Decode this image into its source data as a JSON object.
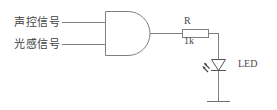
{
  "diagram": {
    "background_color": "#ffffff",
    "line_color": "#808080",
    "text_color": "#4a4a4a",
    "width": 277,
    "height": 110
  },
  "inputs": [
    {
      "label": "声控信号",
      "name": "sound-control-signal",
      "wire_y": 22
    },
    {
      "label": "光感信号",
      "name": "light-sensor-signal",
      "wire_y": 44
    }
  ],
  "gate": {
    "type": "AND",
    "name": "and-gate",
    "x": 105,
    "y": 11,
    "width": 45,
    "height": 44,
    "output_y": 33
  },
  "resistor": {
    "name": "resistor-r",
    "designator": "R",
    "value": "1k",
    "x": 182,
    "y": 29,
    "width": 26,
    "height": 8
  },
  "led": {
    "name": "led-d1",
    "label": "LED",
    "orientation": "cathode-down",
    "x": 218,
    "y": 66
  },
  "ground": {
    "name": "ground-symbol",
    "x": 218,
    "y": 101
  }
}
